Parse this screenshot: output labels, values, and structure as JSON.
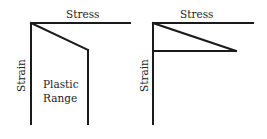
{
  "diagrams": [
    {
      "id": "left",
      "x_axis_label": "Stress",
      "y_axis_label": "Strain",
      "region_label_line1": "Plastic",
      "region_label_line2": "Range"
    },
    {
      "id": "right",
      "x_axis_label": "Stress",
      "y_axis_label": "Strain"
    }
  ],
  "colors": {
    "line": "#1a1a1a",
    "text": "#222222",
    "background": "#ffffff"
  }
}
